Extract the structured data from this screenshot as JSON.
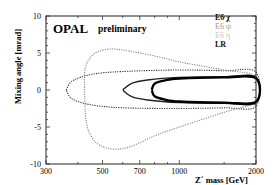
{
  "chart_data": {
    "type": "line",
    "title": "OPAL preliminary",
    "experiment_label": "OPAL",
    "status_label": "preliminary",
    "xlabel": "Z´ mass [GeV]",
    "ylabel": "Mixing angle [mrad]",
    "xscale": "log",
    "xlim": [
      300,
      2000
    ],
    "ylim": [
      -10,
      10
    ],
    "xticks": [
      300,
      500,
      700,
      1000,
      2000
    ],
    "xtick_labels": [
      "300",
      "500",
      "700",
      "1000",
      "2000"
    ],
    "yticks": [
      10,
      5,
      0,
      -5,
      -10
    ],
    "ytick_labels": [
      "10",
      "5",
      "0",
      "-5",
      "-10"
    ],
    "grid": false,
    "legend_position": "upper right (inside)",
    "series": [
      {
        "name": "E6 χ",
        "style": "solid",
        "color": "#222222",
        "points": [
          [
            600,
            0
          ],
          [
            650,
            0.9
          ],
          [
            750,
            1.35
          ],
          [
            1000,
            1.7
          ],
          [
            1500,
            1.8
          ],
          [
            2000,
            1.7
          ],
          [
            2000,
            -1.7
          ],
          [
            1500,
            -1.8
          ],
          [
            1000,
            -1.7
          ],
          [
            750,
            -1.35
          ],
          [
            650,
            -0.9
          ],
          [
            600,
            0
          ]
        ]
      },
      {
        "name": "E6 ψ",
        "style": "dotted",
        "color": "#333333",
        "points": [
          [
            360,
            0
          ],
          [
            380,
            1.2
          ],
          [
            450,
            2.1
          ],
          [
            600,
            2.5
          ],
          [
            1000,
            2.7
          ],
          [
            1500,
            2.6
          ],
          [
            2000,
            2.4
          ],
          [
            2000,
            -2.2
          ],
          [
            1500,
            -2.4
          ],
          [
            1000,
            -2.5
          ],
          [
            600,
            -2.4
          ],
          [
            450,
            -2.0
          ],
          [
            380,
            -1.2
          ],
          [
            360,
            0
          ]
        ]
      },
      {
        "name": "E6 η",
        "style": "dotted",
        "color": "#8a8a8a",
        "points": [
          [
            425,
            0
          ],
          [
            428,
            3.0
          ],
          [
            460,
            4.8
          ],
          [
            520,
            5.5
          ],
          [
            600,
            5.4
          ],
          [
            800,
            4.6
          ],
          [
            1000,
            3.8
          ],
          [
            1500,
            2.7
          ],
          [
            2000,
            1.8
          ],
          [
            2000,
            -1.5
          ],
          [
            1500,
            -3.0
          ],
          [
            1000,
            -5.0
          ],
          [
            800,
            -6.2
          ],
          [
            650,
            -7.6
          ],
          [
            560,
            -8.0
          ],
          [
            490,
            -7.5
          ],
          [
            450,
            -6.2
          ],
          [
            430,
            -4.0
          ],
          [
            425,
            0
          ]
        ]
      },
      {
        "name": "LR",
        "style": "solid-thick",
        "color": "#000000",
        "points": [
          [
            780,
            0
          ],
          [
            800,
            0.85
          ],
          [
            880,
            1.3
          ],
          [
            1000,
            1.55
          ],
          [
            1500,
            1.7
          ],
          [
            2000,
            1.6
          ],
          [
            2000,
            -1.6
          ],
          [
            1500,
            -1.7
          ],
          [
            1000,
            -1.55
          ],
          [
            880,
            -1.3
          ],
          [
            800,
            -0.85
          ],
          [
            780,
            0
          ]
        ]
      }
    ]
  },
  "legend": {
    "items": [
      {
        "label": "E6 χ",
        "color": "#111111"
      },
      {
        "label": "E6 ψ",
        "color": "#9a9a9a"
      },
      {
        "label": "E6 η",
        "color": "#c4c4c4"
      },
      {
        "label": "LR",
        "color": "#111111"
      }
    ]
  },
  "labels": {
    "experiment": "OPAL",
    "status": "preliminary",
    "xlabel": "Z´ mass [GeV]",
    "ylabel": "Mixing angle [mrad]"
  }
}
